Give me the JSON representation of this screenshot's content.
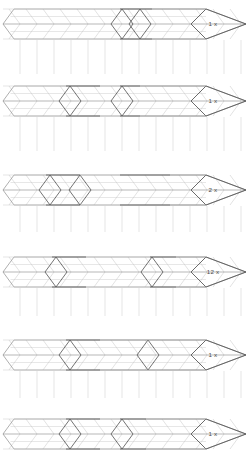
{
  "figure": {
    "background_color": "#ffffff",
    "line_color_light": "#c9c9c9",
    "line_color_mid": "#9a9a9a",
    "line_color_dark": "#5a5a5a",
    "label_color": "#4a4a4a",
    "rows_count": 6
  },
  "rows": [
    {
      "id": "row-1",
      "index": 1,
      "quantity_label": "1 x",
      "quantity_value": 1,
      "quantity_unit": "x",
      "center_y": 24,
      "band_half_height": 15,
      "tip_x": 3,
      "head_x": 206,
      "head_tip_x": 246,
      "chevron_pitch": 17,
      "chevron_depth": 11,
      "segments": [
        {
          "name": "left-run",
          "start_x": 3,
          "end_x": 120,
          "emphasis": "light"
        },
        {
          "name": "highlight-piece",
          "start_x": 120,
          "end_x": 152,
          "emphasis": "dark"
        },
        {
          "name": "right-run",
          "start_x": 152,
          "end_x": 206,
          "emphasis": "mid"
        }
      ],
      "highlight_offsets": [
        122,
        140
      ],
      "grid_drop_from": 40,
      "grid_drop_to": 74
    },
    {
      "id": "row-2",
      "index": 2,
      "quantity_label": "1 x",
      "quantity_value": 1,
      "quantity_unit": "x",
      "center_y": 101,
      "band_half_height": 15,
      "tip_x": 3,
      "head_x": 206,
      "head_tip_x": 246,
      "chevron_pitch": 17,
      "chevron_depth": 11,
      "segments": [
        {
          "name": "left-run",
          "start_x": 3,
          "end_x": 66,
          "emphasis": "light"
        },
        {
          "name": "highlight-piece-a",
          "start_x": 66,
          "end_x": 100,
          "emphasis": "dark"
        },
        {
          "name": "mid-run",
          "start_x": 100,
          "end_x": 120,
          "emphasis": "light"
        },
        {
          "name": "highlight-piece-b",
          "start_x": 120,
          "end_x": 140,
          "emphasis": "dark"
        },
        {
          "name": "right-run",
          "start_x": 140,
          "end_x": 206,
          "emphasis": "mid"
        }
      ],
      "highlight_offsets": [
        70,
        122
      ],
      "grid_drop_from": 117,
      "grid_drop_to": 151
    },
    {
      "id": "row-3",
      "index": 3,
      "quantity_label": "2 x",
      "quantity_value": 2,
      "quantity_unit": "x",
      "center_y": 190,
      "band_half_height": 15,
      "tip_x": 3,
      "head_x": 206,
      "head_tip_x": 246,
      "chevron_pitch": 17,
      "chevron_depth": 11,
      "segments": [
        {
          "name": "left-run",
          "start_x": 3,
          "end_x": 46,
          "emphasis": "light"
        },
        {
          "name": "highlight-piece-a",
          "start_x": 46,
          "end_x": 80,
          "emphasis": "dark"
        },
        {
          "name": "mid-run",
          "start_x": 80,
          "end_x": 120,
          "emphasis": "light"
        },
        {
          "name": "highlight-piece-b",
          "start_x": 120,
          "end_x": 170,
          "emphasis": "dark"
        },
        {
          "name": "right-run",
          "start_x": 170,
          "end_x": 206,
          "emphasis": "mid"
        }
      ],
      "highlight_offsets": [
        50,
        80
      ],
      "grid_drop_from": 206,
      "grid_drop_to": 232
    },
    {
      "id": "row-4",
      "index": 4,
      "quantity_label": "12 x",
      "quantity_value": 12,
      "quantity_unit": "x",
      "center_y": 272,
      "band_half_height": 15,
      "tip_x": 3,
      "head_x": 206,
      "head_tip_x": 246,
      "chevron_pitch": 17,
      "chevron_depth": 11,
      "segments": [
        {
          "name": "left-run",
          "start_x": 3,
          "end_x": 52,
          "emphasis": "light"
        },
        {
          "name": "highlight-piece-a",
          "start_x": 52,
          "end_x": 86,
          "emphasis": "dark"
        },
        {
          "name": "mid-run",
          "start_x": 86,
          "end_x": 150,
          "emphasis": "light"
        },
        {
          "name": "highlight-piece-b",
          "start_x": 150,
          "end_x": 176,
          "emphasis": "dark"
        },
        {
          "name": "right-run",
          "start_x": 176,
          "end_x": 206,
          "emphasis": "mid"
        }
      ],
      "highlight_offsets": [
        56,
        152
      ],
      "grid_drop_from": 288,
      "grid_drop_to": 316
    },
    {
      "id": "row-5",
      "index": 5,
      "quantity_label": "1 x",
      "quantity_value": 1,
      "quantity_unit": "x",
      "center_y": 355,
      "band_half_height": 15,
      "tip_x": 3,
      "head_x": 206,
      "head_tip_x": 246,
      "chevron_pitch": 17,
      "chevron_depth": 11,
      "segments": [
        {
          "name": "left-run",
          "start_x": 3,
          "end_x": 66,
          "emphasis": "light"
        },
        {
          "name": "highlight-piece",
          "start_x": 66,
          "end_x": 100,
          "emphasis": "dark"
        },
        {
          "name": "right-run",
          "start_x": 100,
          "end_x": 206,
          "emphasis": "mid"
        }
      ],
      "highlight_offsets": [
        70,
        148
      ],
      "grid_drop_from": 371,
      "grid_drop_to": 398
    },
    {
      "id": "row-6",
      "index": 6,
      "quantity_label": "1 x",
      "quantity_value": 1,
      "quantity_unit": "x",
      "center_y": 434,
      "band_half_height": 15,
      "tip_x": 3,
      "head_x": 206,
      "head_tip_x": 246,
      "chevron_pitch": 17,
      "chevron_depth": 11,
      "segments": [
        {
          "name": "left-run",
          "start_x": 3,
          "end_x": 66,
          "emphasis": "light"
        },
        {
          "name": "highlight-piece-a",
          "start_x": 66,
          "end_x": 100,
          "emphasis": "dark"
        },
        {
          "name": "mid-run",
          "start_x": 100,
          "end_x": 120,
          "emphasis": "light"
        },
        {
          "name": "highlight-piece-b",
          "start_x": 120,
          "end_x": 146,
          "emphasis": "dark"
        },
        {
          "name": "right-run",
          "start_x": 146,
          "end_x": 206,
          "emphasis": "mid"
        }
      ],
      "highlight_offsets": [
        70,
        122
      ],
      "grid_drop_from": 418,
      "grid_drop_to": 398
    }
  ]
}
